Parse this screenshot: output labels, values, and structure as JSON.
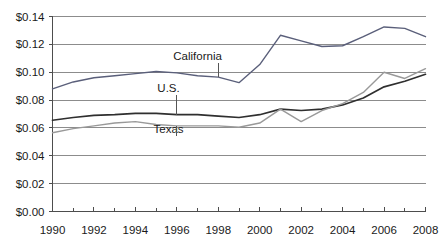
{
  "chart_data": {
    "type": "line",
    "title": "",
    "subtitle": "",
    "xlabel": "",
    "ylabel": "",
    "x": [
      1990,
      1991,
      1992,
      1993,
      1994,
      1995,
      1996,
      1997,
      1998,
      1999,
      2000,
      2001,
      2002,
      2003,
      2004,
      2005,
      2006,
      2007,
      2008
    ],
    "xlim": [
      1990,
      2008
    ],
    "ylim": [
      0.0,
      0.14
    ],
    "grid": true,
    "legend_position": "inline-annotations",
    "x_tick_labels": [
      "1990",
      "1992",
      "1994",
      "1996",
      "1998",
      "2000",
      "2002",
      "2004",
      "2006",
      "2008"
    ],
    "x_tick_values": [
      1990,
      1992,
      1994,
      1996,
      1998,
      2000,
      2002,
      2004,
      2006,
      2008
    ],
    "x_minor_tick_values": [
      1991,
      1993,
      1995,
      1997,
      1999,
      2001,
      2003,
      2005,
      2007
    ],
    "y_tick_labels": [
      "$0.00",
      "$0.02",
      "$0.04",
      "$0.06",
      "$0.08",
      "$0.10",
      "$0.12",
      "$0.14"
    ],
    "y_tick_values": [
      0.0,
      0.02,
      0.04,
      0.06,
      0.08,
      0.1,
      0.12,
      0.14
    ],
    "series": [
      {
        "name": "California",
        "color": "#5a5f7a",
        "label_x": 1997.0,
        "label_y": 0.109,
        "annotation_target_year": 1998,
        "values": [
          0.088,
          0.093,
          0.096,
          0.0975,
          0.099,
          0.1005,
          0.0995,
          0.0975,
          0.0965,
          0.0925,
          0.1055,
          0.1265,
          0.1225,
          0.1185,
          0.119,
          0.1255,
          0.1325,
          0.1315,
          0.1255
        ]
      },
      {
        "name": "U.S.",
        "color": "#2f2f2f",
        "label_x": 1995.6,
        "label_y": 0.0855,
        "annotation_target_year": 1996,
        "values": [
          0.0655,
          0.0675,
          0.069,
          0.0695,
          0.0705,
          0.0705,
          0.0695,
          0.0695,
          0.0685,
          0.0675,
          0.0695,
          0.0735,
          0.0725,
          0.0735,
          0.0765,
          0.0815,
          0.0895,
          0.0935,
          0.0985
        ]
      },
      {
        "name": "Texas",
        "color": "#999999",
        "label_x": 1995.6,
        "label_y": 0.0565,
        "annotation_target_year": 1996,
        "values": [
          0.0565,
          0.0595,
          0.0615,
          0.0635,
          0.0645,
          0.0625,
          0.0615,
          0.0615,
          0.0615,
          0.0605,
          0.0635,
          0.0735,
          0.0645,
          0.0725,
          0.0775,
          0.0855,
          0.1,
          0.0955,
          0.1025
        ]
      }
    ]
  }
}
